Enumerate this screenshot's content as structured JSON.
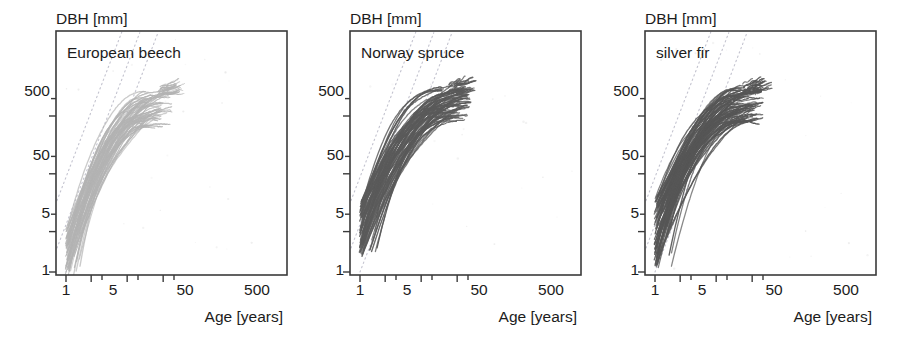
{
  "figure": {
    "panel_count": 3,
    "background_color": "#ffffff",
    "frame_color": "#3a3a3a",
    "refline_color": "#c3c3cf"
  },
  "panels": [
    {
      "id": "european-beech",
      "label": "European beech",
      "line_color": "#b3b3b3",
      "n_curves": 62
    },
    {
      "id": "norway-spruce",
      "label": "Norway spruce",
      "line_color": "#5a5a5a",
      "n_curves": 70
    },
    {
      "id": "silver-fir",
      "label": "silver fir",
      "line_color": "#565656",
      "n_curves": 78
    }
  ],
  "chart_data": {
    "type": "line",
    "title": "",
    "xlabel": "Age [years]",
    "ylabel": "DBH [mm]",
    "xscale": "log",
    "yscale": "log",
    "grid": false,
    "legend_position": "none",
    "xlim": [
      1,
      1500
    ],
    "ylim": [
      1,
      1800
    ],
    "xticks": [
      1,
      5,
      50,
      500
    ],
    "xtick_labels": [
      "1",
      "5",
      "50",
      "500"
    ],
    "xminor_ticks": [
      10,
      100,
      1000
    ],
    "yticks": [
      1,
      5,
      50,
      500
    ],
    "ytick_labels": [
      "1",
      "5",
      "50",
      "500"
    ],
    "yminor_ticks": [
      10,
      100,
      1000
    ],
    "reference_lines": {
      "description": "faint dotted diagonal iso-growth-rate lines on log-log axes",
      "slope": 1.0,
      "count_per_panel": 3,
      "style": "dotted"
    },
    "series": [
      {
        "name": "European beech",
        "panel": 0,
        "color": "#b3b3b3",
        "description": "individual tree DBH-over-age trajectories",
        "n_curves": 62,
        "age_range": [
          1,
          900
        ],
        "dbh_range": [
          1,
          1400
        ],
        "median_start": {
          "age": 1,
          "dbh": 4
        },
        "median_end": {
          "age": 450,
          "dbh": 700
        }
      },
      {
        "name": "Norway spruce",
        "panel": 1,
        "color": "#5a5a5a",
        "description": "individual tree DBH-over-age trajectories",
        "n_curves": 70,
        "age_range": [
          1,
          1100
        ],
        "dbh_range": [
          2,
          1500
        ],
        "median_start": {
          "age": 1,
          "dbh": 4
        },
        "median_end": {
          "age": 400,
          "dbh": 800
        }
      },
      {
        "name": "silver fir",
        "panel": 2,
        "color": "#565656",
        "description": "individual tree DBH-over-age trajectories",
        "n_curves": 78,
        "age_range": [
          1,
          1000
        ],
        "dbh_range": [
          1,
          1500
        ],
        "median_start": {
          "age": 1,
          "dbh": 6
        },
        "median_end": {
          "age": 400,
          "dbh": 800
        }
      }
    ]
  },
  "labels": {
    "y_axis_title": "DBH [mm]",
    "x_axis_title": "Age [years]",
    "xtick_1": "1",
    "xtick_5": "5",
    "xtick_50": "50",
    "xtick_500": "500",
    "ytick_1": "1",
    "ytick_5": "5",
    "ytick_50": "50",
    "ytick_500": "500"
  }
}
